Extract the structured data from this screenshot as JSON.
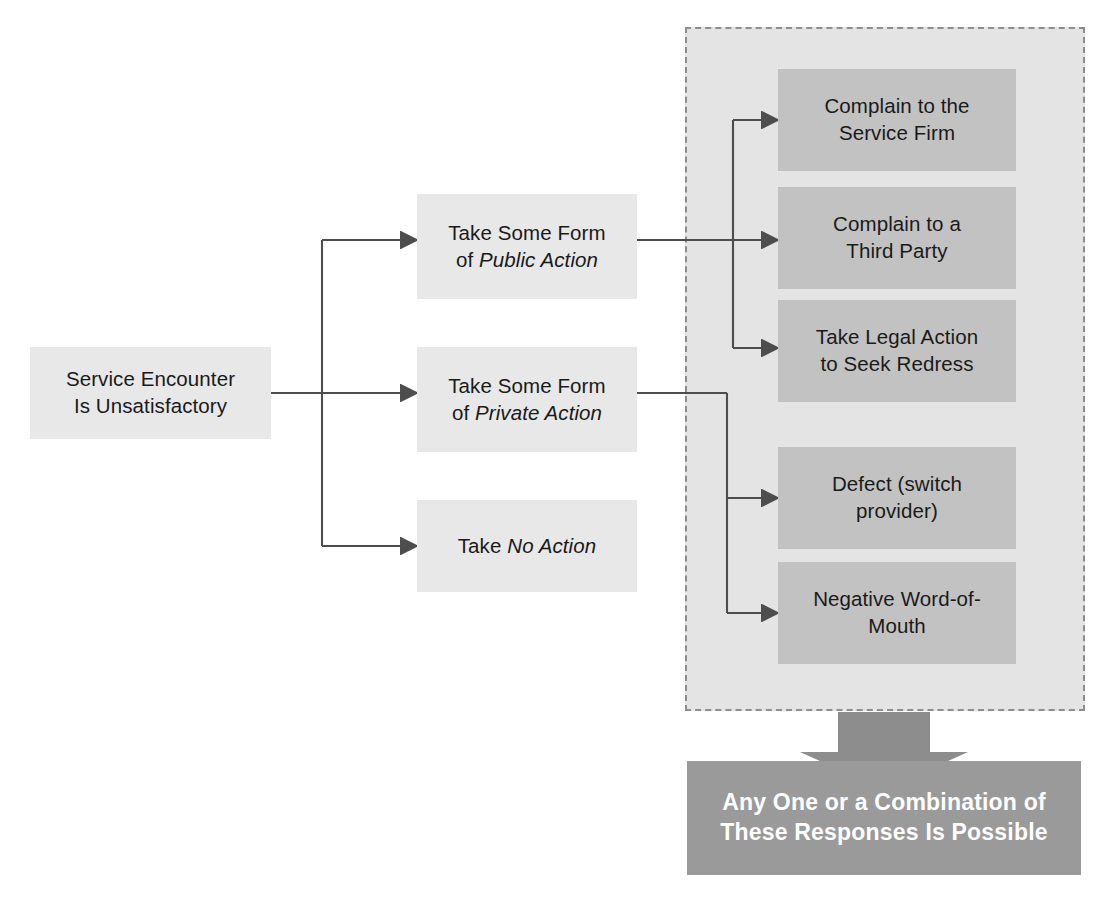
{
  "diagram": {
    "colors": {
      "page_background": "#ffffff",
      "light_node_fill": "#e8e8e8",
      "dark_node_fill": "#c2c2c2",
      "group_fill": "#e4e4e4",
      "group_border": "#8d8d8d",
      "banner_fill": "#9a9a9a",
      "banner_text": "#ffffff",
      "connector_stroke": "#4d4d4d",
      "node_text": "#1a1a1a"
    },
    "start_node": {
      "id": "service-encounter",
      "line1": "Service Encounter",
      "line2": "Is Unsatisfactory",
      "text": "Service Encounter\nIs Unsatisfactory"
    },
    "branch_nodes": [
      {
        "id": "public-action",
        "line1": "Take Some Form",
        "line2_prefix": "of ",
        "line2_emphasis": "Public Action"
      },
      {
        "id": "private-action",
        "line1": "Take Some Form",
        "line2_prefix": "of ",
        "line2_emphasis": "Private Action"
      },
      {
        "id": "no-action",
        "line1": "",
        "line2_prefix": "Take ",
        "line2_emphasis": "No Action"
      }
    ],
    "outcome_nodes": [
      {
        "id": "complain-service-firm",
        "text": "Complain to the\nService Firm",
        "from": "public-action"
      },
      {
        "id": "complain-third-party",
        "text": "Complain to a\nThird Party",
        "from": "public-action"
      },
      {
        "id": "legal-action",
        "text": "Take Legal Action\nto Seek Redress",
        "from": "public-action"
      },
      {
        "id": "defect",
        "text": "Defect (switch\nprovider)",
        "from": "private-action"
      },
      {
        "id": "negative-word-of-mouth",
        "text": "Negative Word-of-\nMouth",
        "from": "private-action"
      }
    ],
    "banner": {
      "id": "summary-banner",
      "line1": "Any One or a Combination of",
      "line2": "These Responses Is Possible",
      "text": "Any One or a Combination of\nThese Responses Is Possible"
    }
  }
}
